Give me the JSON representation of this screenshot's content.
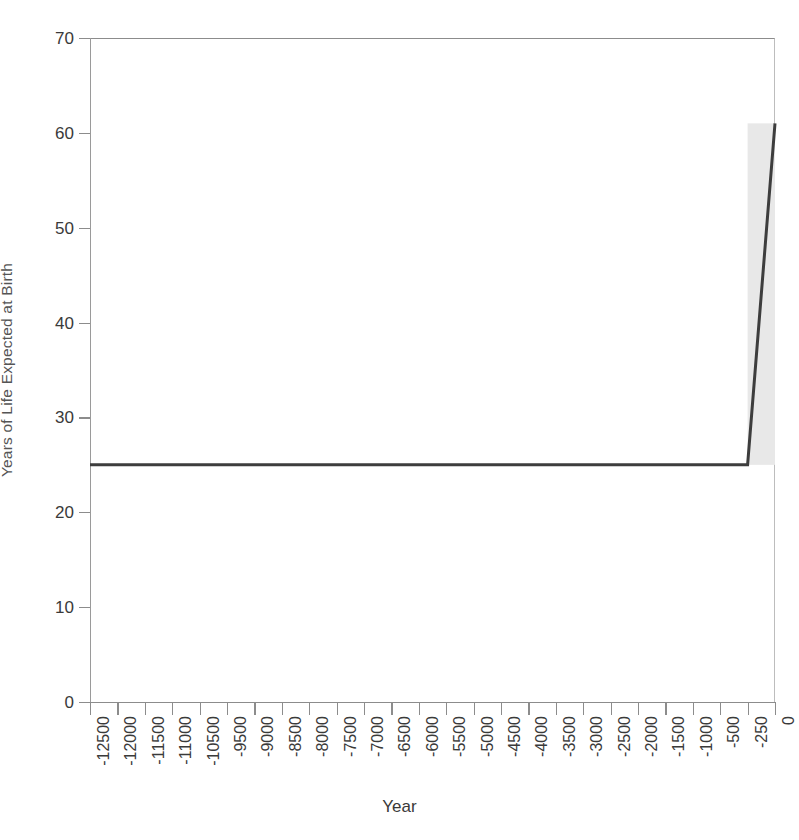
{
  "chart_data": {
    "type": "line",
    "title": "",
    "xlabel": "Year",
    "ylabel": "Years of Life Expected at Birth",
    "categories": [
      "-12500",
      "-12000",
      "-11500",
      "-11000",
      "-10500",
      "-9500",
      "-9000",
      "-8500",
      "-8000",
      "-7500",
      "-7000",
      "-6500",
      "-6000",
      "-5500",
      "-5000",
      "-4500",
      "-4000",
      "-3500",
      "-3000",
      "-2500",
      "-2000",
      "-1500",
      "-1000",
      "-500",
      "-250",
      "0"
    ],
    "values": [
      25,
      25,
      25,
      25,
      25,
      25,
      25,
      25,
      25,
      25,
      25,
      25,
      25,
      25,
      25,
      25,
      25,
      25,
      25,
      25,
      25,
      25,
      25,
      25,
      25,
      61
    ],
    "series": [
      {
        "name": "Life expectancy at birth",
        "values": [
          25,
          25,
          25,
          25,
          25,
          25,
          25,
          25,
          25,
          25,
          25,
          25,
          25,
          25,
          25,
          25,
          25,
          25,
          25,
          25,
          25,
          25,
          25,
          25,
          25,
          61
        ],
        "color": "#3d3d3d"
      }
    ],
    "ylim": [
      0,
      70
    ],
    "yticks": [
      0,
      10,
      20,
      30,
      40,
      50,
      60,
      70
    ],
    "ytick_labels": [
      "0",
      "10",
      "20",
      "30",
      "40",
      "50",
      "60",
      "70"
    ],
    "grid": false,
    "legend": "none",
    "line_color": "#3d3d3d",
    "line_width": 3,
    "shaded_region": {
      "label": "modern era shading",
      "x_start_category": "-250",
      "x_end_category": "0",
      "y_bottom": 25,
      "y_top": 61,
      "color": "#e8e8e8"
    }
  },
  "axis": {
    "y_title": "Years of Life Expected at Birth",
    "x_title": "Year"
  },
  "colors": {
    "line": "#3d3d3d",
    "shade": "#e8e8e8",
    "axis": "#8c8c8c",
    "text": "#3a3a3a",
    "background": "#ffffff"
  }
}
